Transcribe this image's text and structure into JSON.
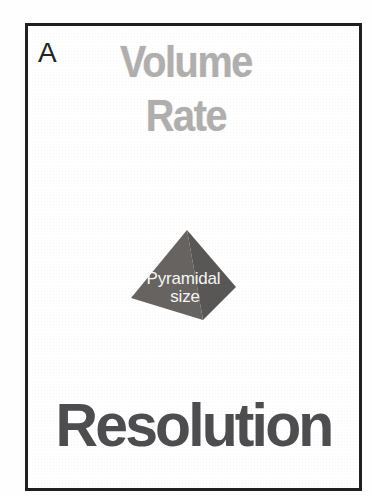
{
  "figure": {
    "panel_label": "A",
    "axis_top": {
      "line1": "Volume",
      "line2": "Rate",
      "color": "#b1aeae"
    },
    "pyramid": {
      "label_line1": "Pyramidal",
      "label_line2": "size",
      "face_left_color": "#666361",
      "face_right_color": "#595755",
      "text_color": "#f7f7f7"
    },
    "axis_bottom": {
      "text": "Resolution",
      "color": "#4d4c4e"
    },
    "frame_color": "#1f1f1f",
    "background_color": "#ffffff"
  }
}
